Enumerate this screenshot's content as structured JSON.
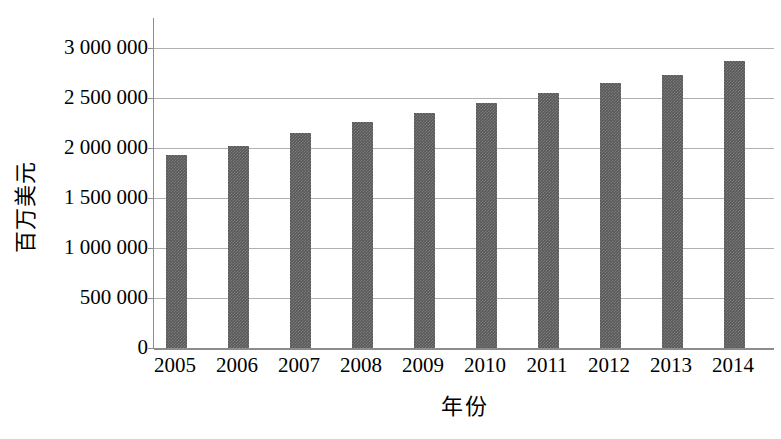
{
  "chart_data": {
    "type": "bar",
    "title": "",
    "subtitle": "",
    "xlabel": "年份",
    "ylabel": "百万美元",
    "categories": [
      "2005",
      "2006",
      "2007",
      "2008",
      "2009",
      "2010",
      "2011",
      "2012",
      "2013",
      "2014"
    ],
    "values": [
      1930000,
      2020000,
      2150000,
      2260000,
      2350000,
      2450000,
      2550000,
      2650000,
      2730000,
      2870000
    ],
    "ylim": [
      0,
      3000000
    ],
    "ytick_values": [
      0,
      500000,
      1000000,
      1500000,
      2000000,
      2500000,
      3000000
    ],
    "ytick_labels": [
      "0",
      "500 000",
      "1 000 000",
      "1 500 000",
      "2 000 000",
      "2 500 000",
      "3 000 000"
    ],
    "grid": true,
    "legend": null,
    "legend_position": "none",
    "annotations": [],
    "bar_color": "#595959",
    "grid_color": "#b0b0b0",
    "axis_color": "#8c8c8c",
    "background_color": "#ffffff"
  }
}
